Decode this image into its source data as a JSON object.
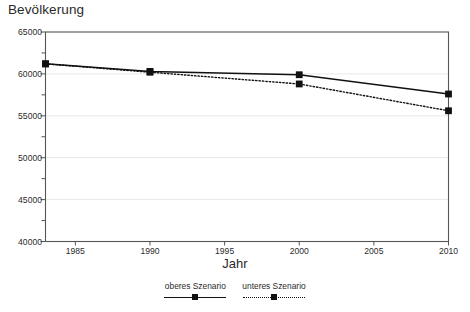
{
  "chart_data": {
    "type": "line",
    "title": "Bevölkerung",
    "xlabel": "Jahr",
    "ylabel": "",
    "x": [
      1983,
      1990,
      2000,
      2010
    ],
    "xlim": [
      1983,
      2010
    ],
    "ylim": [
      40000,
      65000
    ],
    "xticks": [
      1985,
      1990,
      1995,
      2000,
      2005,
      2010
    ],
    "xtick_labels": [
      "1985",
      "1990",
      "1995",
      "2000",
      "2005",
      "2010"
    ],
    "yticks": [
      40000,
      45000,
      50000,
      55000,
      60000,
      65000
    ],
    "ytick_labels": [
      "40000",
      "45000",
      "50000",
      "55000",
      "60000",
      "65000"
    ],
    "yminorticks": [
      42500,
      47500,
      52500,
      57500,
      62500
    ],
    "grid": true,
    "grid_color": "#e8e8e8",
    "legend_position": "bottom",
    "marker": "square",
    "series": [
      {
        "name": "oberes Szenario",
        "style": "solid",
        "color": "#111111",
        "values": [
          61200,
          60300,
          59900,
          57600
        ]
      },
      {
        "name": "unteres Szenario",
        "style": "dotted",
        "color": "#111111",
        "values": [
          61200,
          60200,
          58800,
          55600
        ]
      }
    ]
  },
  "legend": {
    "items": [
      {
        "label": "oberes Szenario"
      },
      {
        "label": "unteres Szenario"
      }
    ]
  },
  "axes": {
    "frame_color": "#555555"
  }
}
